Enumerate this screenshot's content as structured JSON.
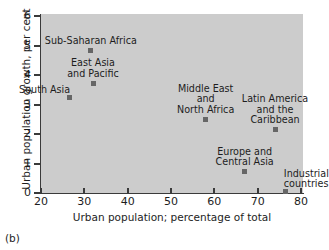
{
  "caption": "(b)",
  "chart_data": {
    "type": "scatter",
    "title": "",
    "xlabel": "Urban population; percentage of total",
    "ylabel": "Urban population growth, per cent",
    "xlim": [
      20,
      80
    ],
    "ylim": [
      0,
      6
    ],
    "xticks": [
      20,
      30,
      40,
      50,
      60,
      70,
      80
    ],
    "yticks": [
      0,
      1,
      2,
      3,
      4,
      5,
      6
    ],
    "grid": false,
    "legend": "none",
    "plot_background": "#cccccc",
    "marker_color": "#666666",
    "points": [
      {
        "label": "Sub-Saharan Africa",
        "x": 31.5,
        "y": 4.82,
        "label_lines": [
          "Sub-Saharan Africa"
        ],
        "label_pos": "above-center"
      },
      {
        "label": "East Asia and Pacific",
        "x": 32.0,
        "y": 3.72,
        "label_lines": [
          "East Asia",
          "and Pacific"
        ],
        "label_pos": "above-center"
      },
      {
        "label": "South Asia",
        "x": 26.5,
        "y": 3.25,
        "label_lines": [
          "South Asia"
        ],
        "label_pos": "above-left"
      },
      {
        "label": "Middle East and North Africa",
        "x": 58.0,
        "y": 2.5,
        "label_lines": [
          "Middle East",
          "and",
          "North Africa"
        ],
        "label_pos": "above-center"
      },
      {
        "label": "Latin America and the Caribbean",
        "x": 74.0,
        "y": 2.15,
        "label_lines": [
          "Latin America",
          "and the",
          "Caribbean"
        ],
        "label_pos": "above-center"
      },
      {
        "label": "Europe and Central Asia",
        "x": 67.0,
        "y": 0.72,
        "label_lines": [
          "Europe and",
          "Central Asia"
        ],
        "label_pos": "above-center"
      },
      {
        "label": "Industrial countries",
        "x": 76.5,
        "y": 0.05,
        "label_lines": [
          "Industrial",
          "countries"
        ],
        "label_pos": "above-right"
      }
    ]
  }
}
